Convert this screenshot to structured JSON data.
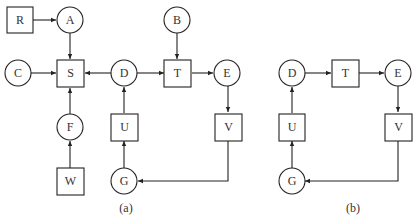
{
  "diagrams": [
    {
      "id": "a",
      "caption": "(a)",
      "nodes": [
        {
          "id": "R",
          "label": "R",
          "shape": "square"
        },
        {
          "id": "A",
          "label": "A",
          "shape": "circle"
        },
        {
          "id": "B",
          "label": "B",
          "shape": "circle"
        },
        {
          "id": "C",
          "label": "C",
          "shape": "circle"
        },
        {
          "id": "S",
          "label": "S",
          "shape": "square"
        },
        {
          "id": "D",
          "label": "D",
          "shape": "circle"
        },
        {
          "id": "T",
          "label": "T",
          "shape": "square"
        },
        {
          "id": "E",
          "label": "E",
          "shape": "circle"
        },
        {
          "id": "F",
          "label": "F",
          "shape": "circle"
        },
        {
          "id": "U",
          "label": "U",
          "shape": "square"
        },
        {
          "id": "V",
          "label": "V",
          "shape": "square"
        },
        {
          "id": "W",
          "label": "W",
          "shape": "square"
        },
        {
          "id": "G",
          "label": "G",
          "shape": "circle"
        }
      ],
      "edges": [
        {
          "from": "R",
          "to": "A"
        },
        {
          "from": "A",
          "to": "S"
        },
        {
          "from": "C",
          "to": "S"
        },
        {
          "from": "D",
          "to": "S"
        },
        {
          "from": "F",
          "to": "S"
        },
        {
          "from": "W",
          "to": "F"
        },
        {
          "from": "D",
          "to": "T"
        },
        {
          "from": "B",
          "to": "T"
        },
        {
          "from": "T",
          "to": "E"
        },
        {
          "from": "E",
          "to": "V"
        },
        {
          "from": "V",
          "to": "G"
        },
        {
          "from": "G",
          "to": "U"
        },
        {
          "from": "U",
          "to": "D"
        }
      ]
    },
    {
      "id": "b",
      "caption": "(b)",
      "nodes": [
        {
          "id": "D",
          "label": "D",
          "shape": "circle"
        },
        {
          "id": "T",
          "label": "T",
          "shape": "square"
        },
        {
          "id": "E",
          "label": "E",
          "shape": "circle"
        },
        {
          "id": "U",
          "label": "U",
          "shape": "square"
        },
        {
          "id": "V",
          "label": "V",
          "shape": "square"
        },
        {
          "id": "G",
          "label": "G",
          "shape": "circle"
        }
      ],
      "edges": [
        {
          "from": "D",
          "to": "T"
        },
        {
          "from": "T",
          "to": "E"
        },
        {
          "from": "E",
          "to": "V"
        },
        {
          "from": "V",
          "to": "G"
        },
        {
          "from": "G",
          "to": "U"
        },
        {
          "from": "U",
          "to": "D"
        }
      ]
    }
  ],
  "labels": {
    "a": {
      "R": "R",
      "A": "A",
      "B": "B",
      "C": "C",
      "S": "S",
      "D": "D",
      "T": "T",
      "E": "E",
      "F": "F",
      "U": "U",
      "V": "V",
      "W": "W",
      "G": "G",
      "caption": "(a)"
    },
    "b": {
      "D": "D",
      "T": "T",
      "E": "E",
      "U": "U",
      "V": "V",
      "G": "G",
      "caption": "(b)"
    }
  },
  "colors": {
    "stroke": "#222222",
    "text": "#333333",
    "background": "#ffffff"
  }
}
